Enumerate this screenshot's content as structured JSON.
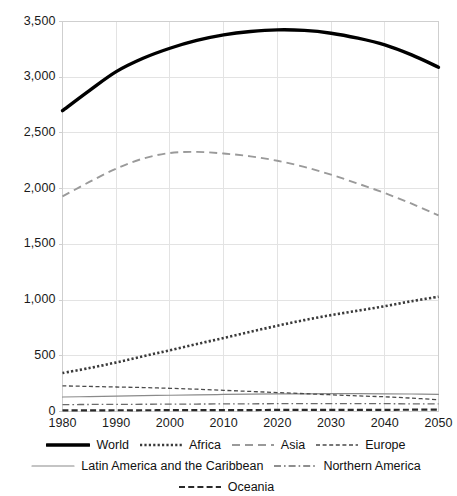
{
  "chart_data": {
    "type": "line",
    "title": "",
    "xlabel": "",
    "ylabel": "",
    "xlim": [
      1980,
      2050
    ],
    "ylim": [
      0,
      3500
    ],
    "grid": true,
    "legend_position": "bottom",
    "x": [
      1980,
      1985,
      1990,
      1995,
      2000,
      2005,
      2010,
      2015,
      2020,
      2025,
      2030,
      2035,
      2040,
      2045,
      2050
    ],
    "y_ticks": [
      0,
      500,
      1000,
      1500,
      2000,
      2500,
      3000,
      3500
    ],
    "y_tick_labels": [
      "0",
      "500",
      "1,000",
      "1,500",
      "2,000",
      "2,500",
      "3,000",
      "3,500"
    ],
    "x_ticks": [
      1980,
      1990,
      2000,
      2010,
      2020,
      2030,
      2040,
      2050
    ],
    "x_tick_labels": [
      "1980",
      "1990",
      "2000",
      "2010",
      "2020",
      "2030",
      "2040",
      "2050"
    ],
    "series": [
      {
        "name": "World",
        "style": "solid-thick",
        "color": "#000000",
        "values": [
          2700,
          2880,
          3050,
          3170,
          3260,
          3330,
          3380,
          3410,
          3425,
          3420,
          3395,
          3350,
          3290,
          3200,
          3090
        ]
      },
      {
        "name": "Africa",
        "style": "dotted",
        "color": "#3a3a3a",
        "values": [
          345,
          390,
          440,
          495,
          550,
          605,
          660,
          715,
          770,
          820,
          865,
          905,
          945,
          990,
          1030
        ]
      },
      {
        "name": "Asia",
        "style": "dashed",
        "color": "#9a9a9a",
        "values": [
          1930,
          2060,
          2180,
          2270,
          2320,
          2330,
          2315,
          2290,
          2250,
          2195,
          2125,
          2045,
          1960,
          1865,
          1760
        ]
      },
      {
        "name": "Europe",
        "style": "dashed-fine",
        "color": "#4a4a4a",
        "values": [
          230,
          225,
          220,
          215,
          208,
          200,
          190,
          180,
          170,
          160,
          150,
          140,
          132,
          120,
          105
        ]
      },
      {
        "name": "Latin America and the Caribbean",
        "style": "solid-thin",
        "color": "#8a8a8a",
        "values": [
          130,
          134,
          138,
          142,
          146,
          150,
          153,
          156,
          158,
          159,
          160,
          160,
          159,
          157,
          154
        ]
      },
      {
        "name": "Northern America",
        "style": "dash-dot",
        "color": "#6a6a6a",
        "values": [
          62,
          63,
          64,
          65,
          66,
          67,
          68,
          69,
          70,
          70,
          70,
          70,
          70,
          69,
          68
        ]
      },
      {
        "name": "Oceania",
        "style": "dashed-bold",
        "color": "#2a2a2a",
        "values": [
          10,
          10,
          11,
          11,
          12,
          12,
          13,
          13,
          14,
          14,
          15,
          15,
          15,
          16,
          16
        ]
      }
    ]
  },
  "legend": {
    "rows": [
      [
        {
          "label": "World",
          "series": 0
        },
        {
          "label": "Africa",
          "series": 1
        },
        {
          "label": "Asia",
          "series": 2
        },
        {
          "label": "Europe",
          "series": 3
        }
      ],
      [
        {
          "label": "Latin America and the Caribbean",
          "series": 4
        },
        {
          "label": "Northern America",
          "series": 5
        }
      ],
      [
        {
          "label": "Oceania",
          "series": 6
        }
      ]
    ]
  },
  "colors": {
    "background": "#ffffff",
    "grid": "#e3e3e3",
    "axis": "#cfcfcf",
    "text": "#1a1a1a"
  }
}
